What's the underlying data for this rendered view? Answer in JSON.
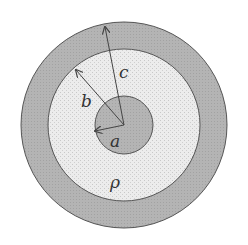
{
  "diagram": {
    "labels": {
      "a": "a",
      "b": "b",
      "c": "c",
      "rho": "ρ"
    },
    "regions": [
      {
        "name": "outer-shell",
        "radius": 103,
        "fill": "#aaaaaa"
      },
      {
        "name": "middle-region",
        "radius": 76,
        "fill": "#e6e6e6"
      },
      {
        "name": "inner-core",
        "radius": 29,
        "fill": "#b0b0b0"
      }
    ],
    "center": [
      124,
      125
    ],
    "colors": {
      "outline": "#555555",
      "arrow": "#444444"
    }
  }
}
